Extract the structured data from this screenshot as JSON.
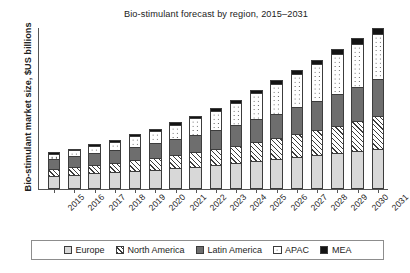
{
  "chart_data": {
    "type": "bar",
    "stacked": true,
    "title": "Bio-stimulant forecast by region, 2015–2031",
    "xlabel": "",
    "ylabel": "Bio-stimulant market size, $US billions",
    "grid": false,
    "legend_position": "bottom",
    "axis_tick_labels_y": [],
    "ylim": [
      0,
      36
    ],
    "categories": [
      "2015",
      "2016",
      "2017",
      "2018",
      "2019",
      "2020",
      "2021",
      "2022",
      "2023",
      "2024",
      "2025",
      "2026",
      "2027",
      "2028",
      "2029",
      "2030",
      "2031"
    ],
    "series": [
      {
        "name": "Europe",
        "color": "#d8d8d8",
        "pattern": "solid",
        "values": [
          3.0,
          3.2,
          3.5,
          3.7,
          4.0,
          4.3,
          4.6,
          5.0,
          5.4,
          5.8,
          6.3,
          6.7,
          7.2,
          7.6,
          8.0,
          8.5,
          9.0
        ]
      },
      {
        "name": "North America",
        "color": "#ffffff",
        "pattern": "diagonal-hatch",
        "values": [
          1.5,
          1.7,
          1.9,
          2.1,
          2.4,
          2.6,
          2.9,
          3.2,
          3.5,
          3.9,
          4.3,
          4.7,
          5.2,
          5.7,
          6.2,
          6.8,
          7.4
        ]
      },
      {
        "name": "Latin America",
        "color": "#6e6e6e",
        "pattern": "solid",
        "values": [
          2.3,
          2.5,
          2.7,
          2.9,
          3.1,
          3.4,
          3.6,
          3.9,
          4.2,
          4.6,
          5.0,
          5.4,
          5.9,
          6.4,
          7.0,
          7.6,
          8.2
        ]
      },
      {
        "name": "APAC",
        "color": "#ffffff",
        "pattern": "dotted",
        "values": [
          1.1,
          1.3,
          1.6,
          1.9,
          2.3,
          2.7,
          3.2,
          3.7,
          4.3,
          5.0,
          5.8,
          6.6,
          7.4,
          8.2,
          9.0,
          9.6,
          10.0
        ]
      },
      {
        "name": "MEA",
        "color": "#131313",
        "pattern": "solid",
        "values": [
          0.3,
          0.3,
          0.4,
          0.4,
          0.5,
          0.5,
          0.6,
          0.6,
          0.7,
          0.7,
          0.8,
          0.9,
          0.9,
          1.0,
          1.1,
          1.2,
          1.3
        ]
      }
    ],
    "totals": [
      8.2,
      9.0,
      10.1,
      11.0,
      12.3,
      13.5,
      14.9,
      16.4,
      18.1,
      20.0,
      22.2,
      24.3,
      26.6,
      28.9,
      31.3,
      33.7,
      35.9
    ]
  },
  "legend": {
    "items": [
      {
        "label": "Europe"
      },
      {
        "label": "North America"
      },
      {
        "label": "Latin America"
      },
      {
        "label": "APAC"
      },
      {
        "label": "MEA"
      }
    ]
  }
}
